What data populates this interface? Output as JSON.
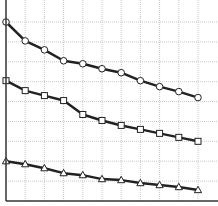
{
  "chart_data": {
    "type": "line",
    "title": "",
    "xlabel": "",
    "ylabel": "",
    "xlim": [
      0,
      10
    ],
    "ylim": [
      0,
      9
    ],
    "grid": true,
    "legend": null,
    "x": [
      0,
      1,
      2,
      3,
      4,
      5,
      6,
      7,
      8,
      9,
      10
    ],
    "series": [
      {
        "name": "circle-series",
        "marker": "circle",
        "values": [
          9.0,
          8.05,
          7.6,
          7.05,
          6.9,
          6.65,
          6.45,
          6.05,
          5.75,
          5.5,
          5.2
        ]
      },
      {
        "name": "square-series",
        "marker": "square",
        "values": [
          6.05,
          5.55,
          5.3,
          5.05,
          4.35,
          4.05,
          3.8,
          3.6,
          3.4,
          3.2,
          3.0
        ]
      },
      {
        "name": "triangle-series",
        "marker": "triangle",
        "values": [
          2.0,
          1.85,
          1.65,
          1.4,
          1.3,
          1.1,
          1.05,
          0.9,
          0.8,
          0.7,
          0.55
        ]
      }
    ]
  },
  "style": {
    "line_color": "#222222",
    "marker_fill": "#ffffff",
    "grid_color": "#c8c8c8",
    "axis_color": "#333333"
  }
}
